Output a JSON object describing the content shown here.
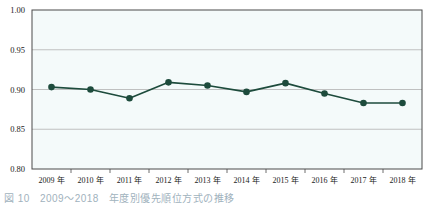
{
  "chart_data": {
    "type": "line",
    "title": "",
    "xlabel": "",
    "ylabel": "",
    "ylim": [
      0.8,
      1.0
    ],
    "yticks": [
      "0.80",
      "0.85",
      "0.90",
      "0.95",
      "1.00"
    ],
    "ytick_values": [
      0.8,
      0.85,
      0.9,
      0.95,
      1.0
    ],
    "grid": true,
    "legend": "none",
    "categories": [
      "2009 年",
      "2010 年",
      "2011 年",
      "2012 年",
      "2013 年",
      "2014 年",
      "2015 年",
      "2016 年",
      "2017 年",
      "2018 年"
    ],
    "series": [
      {
        "name": "",
        "values": [
          0.903,
          0.9,
          0.889,
          0.909,
          0.905,
          0.897,
          0.908,
          0.895,
          0.883,
          0.883
        ],
        "color": "#1d4b3c",
        "marker": "circle"
      }
    ]
  },
  "style": {
    "plot_background": "#f4fafa",
    "grid_color": "#b9b9b9",
    "frame_color": "#4a4a4a",
    "line_color": "#1d4b3c",
    "marker_color": "#1d4b3c",
    "tick_label_color": "#1a1a1a"
  },
  "caption": {
    "number": "図 10",
    "range": "2009～2018",
    "text": "年度別優先順位方式の推移"
  }
}
